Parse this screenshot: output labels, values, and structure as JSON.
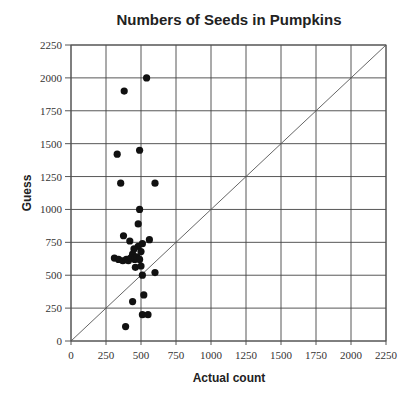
{
  "chart_data": {
    "type": "scatter",
    "title": "Numbers of Seeds in Pumpkins",
    "xlabel": "Actual count",
    "ylabel": "Guess",
    "xlim": [
      0,
      2250
    ],
    "ylim": [
      0,
      2250
    ],
    "x_ticks": [
      0,
      250,
      500,
      750,
      1000,
      1250,
      1500,
      1750,
      2000,
      2250
    ],
    "y_ticks": [
      0,
      250,
      500,
      750,
      1000,
      1250,
      1500,
      1750,
      2000,
      2250
    ],
    "grid": true,
    "legend": null,
    "reference_line": {
      "type": "y=x",
      "from": [
        0,
        0
      ],
      "to": [
        2250,
        2250
      ]
    },
    "series": [
      {
        "name": "Guesses",
        "points": [
          {
            "x": 540,
            "y": 2000
          },
          {
            "x": 380,
            "y": 1900
          },
          {
            "x": 490,
            "y": 1450
          },
          {
            "x": 330,
            "y": 1420
          },
          {
            "x": 355,
            "y": 1200
          },
          {
            "x": 600,
            "y": 1200
          },
          {
            "x": 490,
            "y": 1000
          },
          {
            "x": 480,
            "y": 890
          },
          {
            "x": 375,
            "y": 800
          },
          {
            "x": 420,
            "y": 760
          },
          {
            "x": 560,
            "y": 770
          },
          {
            "x": 480,
            "y": 720
          },
          {
            "x": 510,
            "y": 740
          },
          {
            "x": 450,
            "y": 700
          },
          {
            "x": 500,
            "y": 680
          },
          {
            "x": 440,
            "y": 660
          },
          {
            "x": 310,
            "y": 630
          },
          {
            "x": 340,
            "y": 620
          },
          {
            "x": 370,
            "y": 610
          },
          {
            "x": 395,
            "y": 620
          },
          {
            "x": 410,
            "y": 610
          },
          {
            "x": 425,
            "y": 630
          },
          {
            "x": 455,
            "y": 620
          },
          {
            "x": 470,
            "y": 640
          },
          {
            "x": 490,
            "y": 620
          },
          {
            "x": 460,
            "y": 560
          },
          {
            "x": 500,
            "y": 570
          },
          {
            "x": 510,
            "y": 500
          },
          {
            "x": 600,
            "y": 520
          },
          {
            "x": 440,
            "y": 300
          },
          {
            "x": 520,
            "y": 350
          },
          {
            "x": 510,
            "y": 200
          },
          {
            "x": 550,
            "y": 200
          },
          {
            "x": 390,
            "y": 110
          }
        ]
      }
    ]
  }
}
